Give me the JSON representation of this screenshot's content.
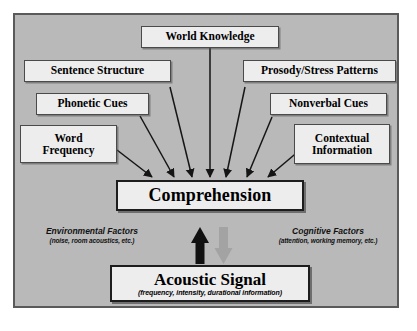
{
  "diagram": {
    "panel": {
      "background_color": "#b9b9b9",
      "border_color": "#5a5a5a"
    },
    "input_nodes": [
      {
        "id": "world-knowledge",
        "label": "World Knowledge"
      },
      {
        "id": "sentence-structure",
        "label": "Sentence Structure"
      },
      {
        "id": "prosody-stress",
        "label": "Prosody/Stress Patterns"
      },
      {
        "id": "phonetic-cues",
        "label": "Phonetic Cues"
      },
      {
        "id": "nonverbal-cues",
        "label": "Nonverbal Cues"
      },
      {
        "id": "word-frequency",
        "line1": "Word",
        "line2": "Frequency"
      },
      {
        "id": "contextual-info",
        "line1": "Contextual",
        "line2": "Information"
      }
    ],
    "comprehension": {
      "label": "Comprehension"
    },
    "acoustic_signal": {
      "label": "Acoustic Signal",
      "sublabel": "(frequency, intensity, durational information)"
    },
    "annotations": [
      {
        "id": "environmental-factors",
        "title": "Environmental Factors",
        "sub": "(noise, room acoustics, etc.)"
      },
      {
        "id": "cognitive-factors",
        "title": "Cognitive Factors",
        "sub": "(attention, working memory, etc.)"
      }
    ],
    "arrows": {
      "converging_count": 7,
      "bottom_up": {
        "name": "bottom-up-arrow",
        "color": "#111111",
        "direction": "up"
      },
      "top_down": {
        "name": "top-down-arrow",
        "color": "#a3a3a3",
        "direction": "down"
      }
    }
  }
}
